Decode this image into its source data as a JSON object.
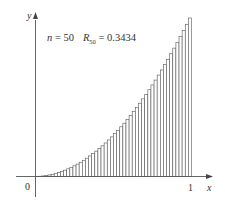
{
  "chart_data": {
    "type": "bar",
    "title": "",
    "annotation": {
      "n_label": "n",
      "n_equals": " = 50",
      "r_label": "R",
      "r_sub": "50",
      "r_equals": " = 0.3434"
    },
    "function": "y = x^2",
    "method": "right Riemann sum",
    "n": 50,
    "R_n": 0.3434,
    "xlabel": "x",
    "ylabel": "y",
    "x_ticks": [
      "0",
      "1"
    ],
    "xlim": [
      0,
      1
    ],
    "ylim": [
      0,
      1
    ],
    "grid": false,
    "legend": "none",
    "bar_width": 0.02,
    "x": [
      0.02,
      0.04,
      0.06,
      0.08,
      0.1,
      0.12,
      0.14,
      0.16,
      0.18,
      0.2,
      0.22,
      0.24,
      0.26,
      0.28,
      0.3,
      0.32,
      0.34,
      0.36,
      0.38,
      0.4,
      0.42,
      0.44,
      0.46,
      0.48,
      0.5,
      0.52,
      0.54,
      0.56,
      0.58,
      0.6,
      0.62,
      0.64,
      0.66,
      0.68,
      0.7,
      0.72,
      0.74,
      0.76,
      0.78,
      0.8,
      0.82,
      0.84,
      0.86,
      0.88,
      0.9,
      0.92,
      0.94,
      0.96,
      0.98,
      1.0
    ],
    "values": [
      0.0004,
      0.0016,
      0.0036,
      0.0064,
      0.01,
      0.0144,
      0.0196,
      0.0256,
      0.0324,
      0.04,
      0.0484,
      0.0576,
      0.0676,
      0.0784,
      0.09,
      0.1024,
      0.1156,
      0.1296,
      0.1444,
      0.16,
      0.1764,
      0.1936,
      0.2116,
      0.2304,
      0.25,
      0.2704,
      0.2916,
      0.3136,
      0.3364,
      0.36,
      0.3844,
      0.4096,
      0.4356,
      0.4624,
      0.49,
      0.5184,
      0.5476,
      0.5776,
      0.6084,
      0.64,
      0.6724,
      0.7056,
      0.7396,
      0.7744,
      0.81,
      0.8464,
      0.8836,
      0.9216,
      0.9604,
      1.0
    ]
  },
  "colors": {
    "bar_fill": "#ffffff",
    "bar_stroke": "#555555",
    "axis": "#555555",
    "text": "#333333"
  }
}
